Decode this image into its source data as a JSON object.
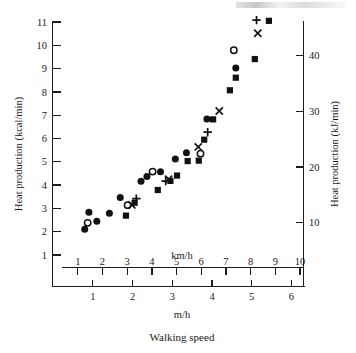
{
  "figure": {
    "caption": "Walking speed",
    "left_axis_title": "Heat production (kcal/min)",
    "right_axis_title": "Heat production (kJ/min)",
    "top_x_unit_label": "km/h",
    "bottom_x_unit_label": "m/h"
  },
  "chart_data": {
    "type": "scatter",
    "title": "",
    "subtitle": "",
    "xlabel": "Walking speed",
    "ylabel": "Heat production (kcal/min)",
    "y2label": "Heat production (kJ/min)",
    "xlabel_primary_unit": "km/h",
    "xlabel_secondary_unit": "m/h",
    "xlim": [
      0.5,
      10
    ],
    "ylim": [
      0.6,
      11.4
    ],
    "y2lim": [
      2.5,
      47.7
    ],
    "grid": false,
    "legend": "none",
    "x_ticks_kmh": [
      1,
      2,
      3,
      4,
      5,
      6,
      7,
      8,
      9,
      10
    ],
    "x_ticks_mph": [
      1,
      2,
      3,
      4,
      5,
      6
    ],
    "y_ticks_kcal": [
      1,
      2,
      3,
      4,
      5,
      6,
      7,
      8,
      9,
      10,
      11
    ],
    "y_ticks_kj": [
      10,
      20,
      30,
      40
    ],
    "mph_to_kmh": 1.609,
    "kcal_to_kj": 4.184,
    "series": [
      {
        "name": "filled-circle",
        "marker": "filled-circle",
        "points": [
          [
            1.28,
            2.11
          ],
          [
            1.45,
            2.84
          ],
          [
            1.77,
            2.45
          ],
          [
            2.28,
            2.79
          ],
          [
            2.72,
            3.47
          ],
          [
            3.56,
            4.16
          ],
          [
            3.8,
            4.37
          ],
          [
            4.35,
            4.57
          ],
          [
            4.95,
            5.12
          ],
          [
            5.4,
            5.39
          ],
          [
            6.23,
            6.84
          ],
          [
            7.4,
            9.03
          ]
        ]
      },
      {
        "name": "open-circle",
        "marker": "open-circle",
        "points": [
          [
            1.4,
            2.38
          ],
          [
            3.02,
            3.14
          ],
          [
            4.03,
            4.58
          ],
          [
            5.97,
            5.35
          ],
          [
            7.32,
            9.79
          ]
        ]
      },
      {
        "name": "filled-square",
        "marker": "filled-square",
        "points": [
          [
            2.95,
            2.69
          ],
          [
            3.3,
            3.24
          ],
          [
            4.24,
            3.79
          ],
          [
            4.75,
            4.18
          ],
          [
            5.02,
            4.41
          ],
          [
            5.45,
            5.03
          ],
          [
            5.9,
            5.05
          ],
          [
            6.12,
            5.95
          ],
          [
            6.48,
            6.82
          ],
          [
            7.16,
            8.07
          ],
          [
            7.4,
            8.61
          ],
          [
            8.17,
            9.41
          ],
          [
            8.74,
            11.05
          ]
        ]
      },
      {
        "name": "cross",
        "marker": "cross",
        "points": [
          [
            3.19,
            3.15
          ],
          [
            4.68,
            4.25
          ],
          [
            5.88,
            5.64
          ],
          [
            6.73,
            7.18
          ],
          [
            8.29,
            10.52
          ]
        ]
      },
      {
        "name": "plus",
        "marker": "plus",
        "points": [
          [
            3.37,
            3.42
          ],
          [
            4.56,
            4.17
          ],
          [
            6.26,
            6.27
          ],
          [
            8.24,
            11.08
          ]
        ]
      }
    ]
  }
}
